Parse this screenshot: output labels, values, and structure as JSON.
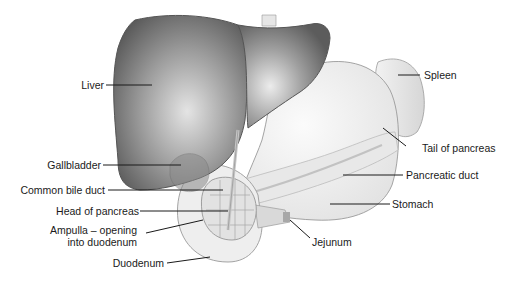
{
  "figure": {
    "labels": {
      "liver": "Liver",
      "gallbladder": "Gallbladder",
      "common_bile_duct": "Common bile duct",
      "head_of_pancreas": "Head of pancreas",
      "ampulla_line1": "Ampulla – opening",
      "ampulla_line2": "into duodenum",
      "duodenum": "Duodenum",
      "spleen": "Spleen",
      "tail_of_pancreas": "Tail of pancreas",
      "pancreatic_duct": "Pancreatic duct",
      "stomach": "Stomach",
      "jejunum": "Jejunum"
    },
    "colors": {
      "liver_dark": "#5e5e5e",
      "liver_light": "#d8d8d8",
      "organ_fill": "#efefef",
      "outline": "#8a8a8a",
      "leader": "#1a1a1a"
    }
  }
}
